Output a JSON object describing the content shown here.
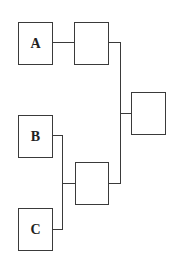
{
  "diagram": {
    "type": "bracket",
    "nodes": [
      {
        "id": "A",
        "label": "A"
      },
      {
        "id": "B",
        "label": "B"
      },
      {
        "id": "C",
        "label": "C"
      },
      {
        "id": "AB",
        "label": ""
      },
      {
        "id": "BC",
        "label": ""
      },
      {
        "id": "final",
        "label": ""
      }
    ],
    "edges": [
      [
        "A",
        "AB"
      ],
      [
        "B",
        "BC"
      ],
      [
        "C",
        "BC"
      ],
      [
        "AB",
        "final"
      ],
      [
        "BC",
        "final"
      ]
    ]
  }
}
